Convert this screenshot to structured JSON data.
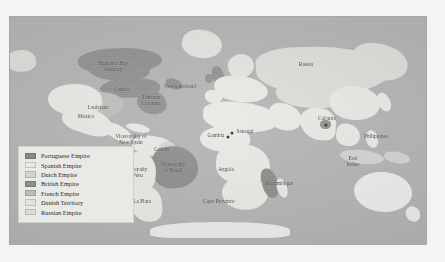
{
  "figure": {
    "kind": "historical-world-map",
    "ocean_color": "#b2b2b2",
    "page_background": "#f4f4f2"
  },
  "legend": {
    "background": "#e9e9e6",
    "border_color": "#cfcfcb",
    "items": [
      {
        "label": "Portuguese Empire",
        "color": "#8a8a88"
      },
      {
        "label": "Spanish Empire",
        "color": "#e8e8e5"
      },
      {
        "label": "Dutch Empire",
        "color": "#d2d2cf"
      },
      {
        "label": "British Empire",
        "color": "#8e8e8c"
      },
      {
        "label": "French Empire",
        "color": "#bdbdba"
      },
      {
        "label": "Danish Territory",
        "color": "#e2e2df"
      },
      {
        "label": "Russian Empire",
        "color": "#dcdcd9"
      }
    ]
  },
  "map_labels": [
    {
      "name": "hudsons-bay-territory",
      "text": "Hudson's Bay\nTerritory",
      "x": 113,
      "y": 66
    },
    {
      "name": "canada",
      "text": "Canada",
      "x": 122,
      "y": 89
    },
    {
      "name": "newfoundland",
      "text": "Newfoundland",
      "x": 180,
      "y": 86
    },
    {
      "name": "thirteen-colonies",
      "text": "Thirteen\nColonies",
      "x": 151,
      "y": 100
    },
    {
      "name": "louisiana",
      "text": "Louisiana",
      "x": 98,
      "y": 107
    },
    {
      "name": "mexico",
      "text": "Mexico",
      "x": 86,
      "y": 116
    },
    {
      "name": "viceroyalty-new-spain",
      "text": "Viceroyalty of\nNew Spain",
      "x": 131,
      "y": 139
    },
    {
      "name": "guiana",
      "text": "Guiana",
      "x": 162,
      "y": 149
    },
    {
      "name": "viceroyalty-brazil",
      "text": "Viceroyalty\nof Brazil",
      "x": 173,
      "y": 167
    },
    {
      "name": "viceroyalty-peru",
      "text": "Viceroyalty\nof Peru",
      "x": 135,
      "y": 172
    },
    {
      "name": "la-plata",
      "text": "La Plata",
      "x": 142,
      "y": 201
    },
    {
      "name": "gambia",
      "text": "Gambia",
      "x": 216,
      "y": 135
    },
    {
      "name": "senegal",
      "text": "Senegal",
      "x": 245,
      "y": 131
    },
    {
      "name": "angola",
      "text": "Angola",
      "x": 226,
      "y": 169
    },
    {
      "name": "mozambique",
      "text": "Mozambique",
      "x": 279,
      "y": 183
    },
    {
      "name": "cape-province",
      "text": "Cape Province",
      "x": 219,
      "y": 201
    },
    {
      "name": "russia",
      "text": "Russia",
      "x": 306,
      "y": 64
    },
    {
      "name": "calcutta",
      "text": "Calcutta",
      "x": 327,
      "y": 118
    },
    {
      "name": "philippines",
      "text": "Philippines",
      "x": 376,
      "y": 136
    },
    {
      "name": "east-indies",
      "text": "East\nIndies",
      "x": 353,
      "y": 161
    }
  ],
  "city_markers": [
    {
      "name": "calcutta-marker",
      "x": 326,
      "y": 125
    },
    {
      "name": "gambia-marker",
      "x": 228,
      "y": 137
    },
    {
      "name": "senegal-marker",
      "x": 232,
      "y": 133
    }
  ],
  "landmasses": [
    {
      "name": "alaska",
      "empire": "russian",
      "x": 6,
      "y": 50,
      "w": 30,
      "h": 22,
      "r": "45% 55% 40% 60%",
      "rot": -8
    },
    {
      "name": "greenland",
      "empire": "danish",
      "x": 182,
      "y": 30,
      "w": 40,
      "h": 28,
      "r": "50% 50% 55% 45%",
      "rot": 12
    },
    {
      "name": "north-canada",
      "empire": "british",
      "x": 78,
      "y": 48,
      "w": 84,
      "h": 26,
      "r": "40% 60% 45% 55%",
      "rot": -4
    },
    {
      "name": "hudsons-bay-land",
      "empire": "british",
      "x": 88,
      "y": 57,
      "w": 62,
      "h": 24,
      "r": "45% 55% 50% 50%",
      "rot": 3
    },
    {
      "name": "canada-band",
      "empire": "british",
      "x": 100,
      "y": 78,
      "w": 60,
      "h": 20,
      "r": "40% 60% 35% 65%",
      "rot": -6
    },
    {
      "name": "newfoundland-isle",
      "empire": "british",
      "x": 165,
      "y": 79,
      "w": 18,
      "h": 10,
      "r": "50%",
      "rot": 20
    },
    {
      "name": "thirteen-colonies-land",
      "empire": "british",
      "x": 137,
      "y": 90,
      "w": 30,
      "h": 24,
      "r": "35% 65% 45% 55%",
      "rot": 8
    },
    {
      "name": "louisiana-land",
      "empire": "french",
      "x": 78,
      "y": 92,
      "w": 46,
      "h": 26,
      "r": "40% 60% 50% 50%",
      "rot": -5
    },
    {
      "name": "usa-west",
      "empire": "spanish",
      "x": 48,
      "y": 84,
      "w": 54,
      "h": 32,
      "r": "45% 55% 40% 60%",
      "rot": -3
    },
    {
      "name": "mexico-land",
      "empire": "spanish",
      "x": 62,
      "y": 108,
      "w": 52,
      "h": 26,
      "r": "30% 70% 55% 45%",
      "rot": 18
    },
    {
      "name": "central-america",
      "empire": "spanish",
      "x": 104,
      "y": 126,
      "w": 30,
      "h": 14,
      "r": "40% 60% 50% 50%",
      "rot": 28
    },
    {
      "name": "caribbean",
      "empire": "spanish",
      "x": 126,
      "y": 124,
      "w": 24,
      "h": 8,
      "r": "50%",
      "rot": 12
    },
    {
      "name": "colombia-venezuela",
      "empire": "spanish",
      "x": 132,
      "y": 136,
      "w": 42,
      "h": 20,
      "r": "45% 55% 50% 50%",
      "rot": 6
    },
    {
      "name": "guiana-land",
      "empire": "dutch",
      "x": 159,
      "y": 142,
      "w": 16,
      "h": 10,
      "r": "45%",
      "rot": 0
    },
    {
      "name": "brazil",
      "empire": "portuguese",
      "x": 152,
      "y": 146,
      "w": 46,
      "h": 42,
      "r": "40% 60% 50% 45%",
      "rot": -6
    },
    {
      "name": "peru-bolivia",
      "empire": "spanish",
      "x": 124,
      "y": 152,
      "w": 32,
      "h": 40,
      "r": "45% 55% 40% 60%",
      "rot": 6
    },
    {
      "name": "la-plata-land",
      "empire": "spanish",
      "x": 130,
      "y": 186,
      "w": 32,
      "h": 36,
      "r": "45% 55% 35% 65%",
      "rot": -4
    },
    {
      "name": "britain",
      "empire": "british",
      "x": 212,
      "y": 66,
      "w": 12,
      "h": 20,
      "r": "45% 55% 40% 60%",
      "rot": -12
    },
    {
      "name": "ireland",
      "empire": "british",
      "x": 205,
      "y": 74,
      "w": 8,
      "h": 9,
      "r": "50%",
      "rot": 0
    },
    {
      "name": "scandinavia",
      "empire": "danish",
      "x": 228,
      "y": 54,
      "w": 26,
      "h": 24,
      "r": "45% 55% 50% 50%",
      "rot": -18
    },
    {
      "name": "europe",
      "empire": "spanish",
      "x": 214,
      "y": 76,
      "w": 54,
      "h": 26,
      "r": "40% 60% 45% 55%",
      "rot": 4
    },
    {
      "name": "iberia",
      "empire": "spanish",
      "x": 205,
      "y": 90,
      "w": 18,
      "h": 13,
      "r": "40% 60% 50% 50%",
      "rot": 0
    },
    {
      "name": "russia-land",
      "empire": "russian",
      "x": 256,
      "y": 46,
      "w": 132,
      "h": 48,
      "r": "30% 70% 40% 60%",
      "rot": -3
    },
    {
      "name": "siberia-east",
      "empire": "russian",
      "x": 352,
      "y": 44,
      "w": 56,
      "h": 36,
      "r": "40% 60% 50% 50%",
      "rot": 8
    },
    {
      "name": "central-asia",
      "empire": "russian",
      "x": 276,
      "y": 82,
      "w": 70,
      "h": 26,
      "r": "40% 60% 45% 55%",
      "rot": 2
    },
    {
      "name": "north-africa",
      "empire": "spanish",
      "x": 203,
      "y": 102,
      "w": 76,
      "h": 30,
      "r": "35% 65% 45% 55%",
      "rot": 2
    },
    {
      "name": "west-africa",
      "empire": "spanish",
      "x": 200,
      "y": 126,
      "w": 50,
      "h": 26,
      "r": "45% 55% 40% 60%",
      "rot": -4
    },
    {
      "name": "central-africa",
      "empire": "spanish",
      "x": 216,
      "y": 144,
      "w": 54,
      "h": 40,
      "r": "45% 55% 50% 45%",
      "rot": 4
    },
    {
      "name": "southern-africa",
      "empire": "spanish",
      "x": 222,
      "y": 176,
      "w": 46,
      "h": 34,
      "r": "45% 55% 45% 55%",
      "rot": -6
    },
    {
      "name": "mozambique-coast",
      "empire": "portuguese",
      "x": 262,
      "y": 168,
      "w": 16,
      "h": 30,
      "r": "40% 60% 50% 50%",
      "rot": -14
    },
    {
      "name": "madagascar",
      "empire": "spanish",
      "x": 277,
      "y": 178,
      "w": 10,
      "h": 20,
      "r": "50%",
      "rot": -18
    },
    {
      "name": "arabia",
      "empire": "spanish",
      "x": 268,
      "y": 104,
      "w": 34,
      "h": 26,
      "r": "40% 60% 50% 50%",
      "rot": 14
    },
    {
      "name": "india",
      "empire": "spanish",
      "x": 300,
      "y": 108,
      "w": 36,
      "h": 32,
      "r": "45% 55% 30% 70%",
      "rot": 4
    },
    {
      "name": "bengal-british",
      "empire": "british",
      "x": 320,
      "y": 120,
      "w": 11,
      "h": 9,
      "r": "45%",
      "rot": 0
    },
    {
      "name": "china",
      "empire": "spanish",
      "x": 330,
      "y": 86,
      "w": 50,
      "h": 34,
      "r": "40% 60% 45% 55%",
      "rot": -2
    },
    {
      "name": "southeast-asia",
      "empire": "spanish",
      "x": 336,
      "y": 124,
      "w": 24,
      "h": 22,
      "r": "40% 60% 50% 50%",
      "rot": 10
    },
    {
      "name": "japan",
      "empire": "spanish",
      "x": 378,
      "y": 92,
      "w": 12,
      "h": 20,
      "r": "50% 50% 45% 55%",
      "rot": -24
    },
    {
      "name": "philippines-isles",
      "empire": "spanish",
      "x": 366,
      "y": 130,
      "w": 12,
      "h": 18,
      "r": "50%",
      "rot": -14
    },
    {
      "name": "east-indies-isles",
      "empire": "dutch",
      "x": 340,
      "y": 150,
      "w": 44,
      "h": 14,
      "r": "50%",
      "rot": 6
    },
    {
      "name": "new-guinea",
      "empire": "dutch",
      "x": 384,
      "y": 152,
      "w": 26,
      "h": 11,
      "r": "45%",
      "rot": 10
    },
    {
      "name": "australia",
      "empire": "unclaimed",
      "x": 354,
      "y": 172,
      "w": 58,
      "h": 40,
      "r": "45% 55% 45% 55%",
      "rot": -2
    },
    {
      "name": "new-zealand",
      "empire": "unclaimed",
      "x": 406,
      "y": 206,
      "w": 14,
      "h": 16,
      "r": "50%",
      "rot": -30
    },
    {
      "name": "antarctic-edge",
      "empire": "unclaimed",
      "x": 150,
      "y": 222,
      "w": 140,
      "h": 16,
      "r": "50% 50% 20% 20%",
      "rot": 0
    }
  ]
}
